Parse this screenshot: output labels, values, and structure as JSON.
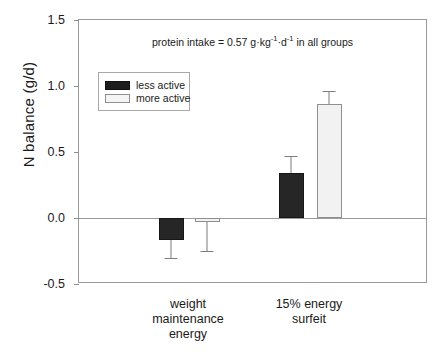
{
  "chart_data": {
    "type": "bar",
    "title": "",
    "xlabel": "",
    "ylabel": "N balance (g/d)",
    "ylim": [
      -0.5,
      1.5
    ],
    "yticks": [
      "-0.5",
      "0.0",
      "0.5",
      "1.0",
      "1.5"
    ],
    "ytick_values": [
      -0.5,
      0.0,
      0.5,
      1.0,
      1.5
    ],
    "grid": false,
    "zero_line": true,
    "legend_position": "upper left",
    "categories": [
      "weight maintenance energy",
      "15% energy surfeit"
    ],
    "category_lines": [
      [
        "weight",
        "maintenance",
        "energy"
      ],
      [
        "15% energy",
        "surfeit"
      ]
    ],
    "series": [
      {
        "name": "less active",
        "color": "#262626",
        "values": [
          -0.17,
          0.34
        ],
        "errors": [
          0.14,
          0.13
        ]
      },
      {
        "name": "more active",
        "color": "#f2f2f2",
        "values": [
          -0.03,
          0.86
        ],
        "errors": [
          0.23,
          0.1
        ]
      }
    ],
    "annotations": [
      {
        "text_plain": "protein intake = 0.57 g·kg-1·d-1 in all groups",
        "prefix": "protein intake = 0.57 g·kg",
        "sup1": "-1",
        "middle": "·d",
        "sup2": "-1",
        "suffix": " in all groups"
      }
    ]
  },
  "legend": {
    "items": [
      {
        "label": "less active"
      },
      {
        "label": "more active"
      }
    ]
  }
}
